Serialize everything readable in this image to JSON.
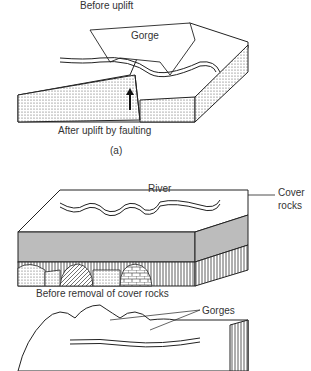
{
  "figure_a": {
    "label_before": "Before uplift",
    "label_gorge": "Gorge",
    "label_after": "After uplift by faulting",
    "panel_label": "(a)"
  },
  "figure_b": {
    "label_river": "River",
    "label_cover_line1": "Cover",
    "label_cover_line2": "rocks",
    "label_before_removal": "Before removal of cover rocks",
    "label_gorges": "Gorges"
  }
}
